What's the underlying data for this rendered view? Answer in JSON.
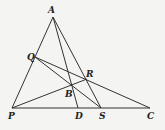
{
  "diagram": {
    "type": "geometry-triangle",
    "points": {
      "A": {
        "label": "A",
        "x": 53,
        "y": 17,
        "lx": 48,
        "ly": 13
      },
      "P": {
        "label": "P",
        "x": 12,
        "y": 108,
        "lx": 8,
        "ly": 119
      },
      "C": {
        "label": "C",
        "x": 150,
        "y": 108,
        "lx": 147,
        "ly": 119
      },
      "D": {
        "label": "D",
        "x": 78,
        "y": 108,
        "lx": 75,
        "ly": 119
      },
      "S": {
        "label": "S",
        "x": 101,
        "y": 108,
        "lx": 99,
        "ly": 119
      },
      "Q": {
        "label": "Q",
        "x": 35,
        "y": 57,
        "lx": 27,
        "ly": 60
      },
      "R": {
        "label": "R",
        "x": 87,
        "y": 79,
        "lx": 86,
        "ly": 77
      },
      "B": {
        "label": "B",
        "x": 71,
        "y": 86,
        "lx": 65,
        "ly": 97
      }
    },
    "segments": [
      [
        "A",
        "P"
      ],
      [
        "A",
        "S"
      ],
      [
        "A",
        "D"
      ],
      [
        "P",
        "C"
      ],
      [
        "Q",
        "C"
      ],
      [
        "Q",
        "S"
      ],
      [
        "P",
        "R"
      ]
    ]
  }
}
